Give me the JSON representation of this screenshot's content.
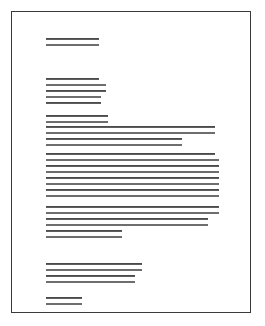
{
  "document": {
    "kind": "scanned-text-page",
    "page_background": "#ffffff",
    "border_color": "#3a3a3a",
    "ink_color": "#2f2f2f",
    "page_frame": {
      "left": 11,
      "top": 11,
      "width": 240,
      "height": 302
    },
    "blocks": [
      {
        "name": "heading-block",
        "lines": [
          {
            "left": 34,
            "top": 26,
            "width": 53
          },
          {
            "left": 34,
            "top": 32,
            "width": 53
          }
        ]
      },
      {
        "name": "intro-block",
        "lines": [
          {
            "left": 34,
            "top": 66,
            "width": 53
          },
          {
            "left": 34,
            "top": 72,
            "width": 60
          },
          {
            "left": 34,
            "top": 78,
            "width": 60
          },
          {
            "left": 34,
            "top": 84,
            "width": 55
          },
          {
            "left": 34,
            "top": 90,
            "width": 55
          }
        ]
      },
      {
        "name": "lead-block",
        "lines": [
          {
            "left": 34,
            "top": 103,
            "width": 62
          },
          {
            "left": 34,
            "top": 109,
            "width": 62
          }
        ]
      },
      {
        "name": "paragraph-block-1",
        "lines": [
          {
            "left": 34,
            "top": 114,
            "width": 169
          },
          {
            "left": 34,
            "top": 120,
            "width": 169
          },
          {
            "left": 34,
            "top": 126,
            "width": 136
          },
          {
            "left": 34,
            "top": 132,
            "width": 136
          }
        ]
      },
      {
        "name": "paragraph-block-2",
        "lines": [
          {
            "left": 34,
            "top": 141,
            "width": 169
          },
          {
            "left": 34,
            "top": 147,
            "width": 173
          },
          {
            "left": 34,
            "top": 153,
            "width": 173
          },
          {
            "left": 34,
            "top": 159,
            "width": 173
          },
          {
            "left": 34,
            "top": 165,
            "width": 173
          },
          {
            "left": 34,
            "top": 171,
            "width": 173
          },
          {
            "left": 34,
            "top": 177,
            "width": 173
          },
          {
            "left": 34,
            "top": 183,
            "width": 173
          }
        ]
      },
      {
        "name": "paragraph-block-3",
        "lines": [
          {
            "left": 34,
            "top": 194,
            "width": 173
          },
          {
            "left": 34,
            "top": 200,
            "width": 173
          },
          {
            "left": 34,
            "top": 206,
            "width": 162
          },
          {
            "left": 34,
            "top": 212,
            "width": 162
          },
          {
            "left": 34,
            "top": 218,
            "width": 76
          },
          {
            "left": 34,
            "top": 224,
            "width": 76
          }
        ]
      },
      {
        "name": "closing-block",
        "lines": [
          {
            "left": 34,
            "top": 251,
            "width": 96
          },
          {
            "left": 34,
            "top": 257,
            "width": 96
          },
          {
            "left": 34,
            "top": 263,
            "width": 89
          },
          {
            "left": 34,
            "top": 269,
            "width": 89
          }
        ]
      },
      {
        "name": "signature-block",
        "lines": [
          {
            "left": 34,
            "top": 285,
            "width": 36
          },
          {
            "left": 34,
            "top": 291,
            "width": 36
          }
        ]
      }
    ]
  }
}
